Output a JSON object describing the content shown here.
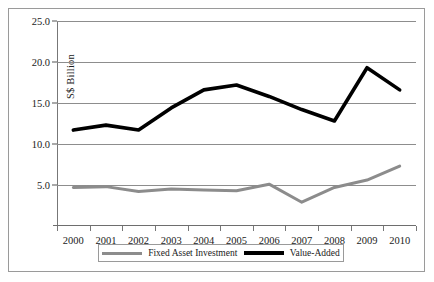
{
  "chart_data": {
    "type": "line",
    "title": "",
    "xlabel": "",
    "ylabel": "S$ Billion",
    "categories": [
      "2000",
      "2001",
      "2002",
      "2003",
      "2004",
      "2005",
      "2006",
      "2007",
      "2008",
      "2009",
      "2010"
    ],
    "ylim": [
      0,
      25
    ],
    "yticks": [
      5.0,
      10.0,
      15.0,
      20.0,
      25.0
    ],
    "ytick_labels": [
      "5.0",
      "10.0",
      "15.0",
      "20.0",
      "25.0"
    ],
    "grid": true,
    "legend_position": "bottom",
    "series": [
      {
        "name": "Fixed Asset Investment",
        "color": "#8c8c8c",
        "width": 3,
        "values": [
          4.7,
          4.8,
          4.2,
          4.5,
          4.4,
          4.3,
          5.1,
          2.9,
          4.7,
          5.6,
          7.3
        ]
      },
      {
        "name": "Value-Added",
        "color": "#000000",
        "width": 3.6,
        "values": [
          11.7,
          12.3,
          11.7,
          14.4,
          16.6,
          17.2,
          15.8,
          14.2,
          12.8,
          19.3,
          16.6
        ]
      }
    ]
  },
  "legend": {
    "entries": [
      {
        "label": "Fixed Asset Investment",
        "color": "#8c8c8c"
      },
      {
        "label": "Value-Added",
        "color": "#000000"
      }
    ]
  }
}
